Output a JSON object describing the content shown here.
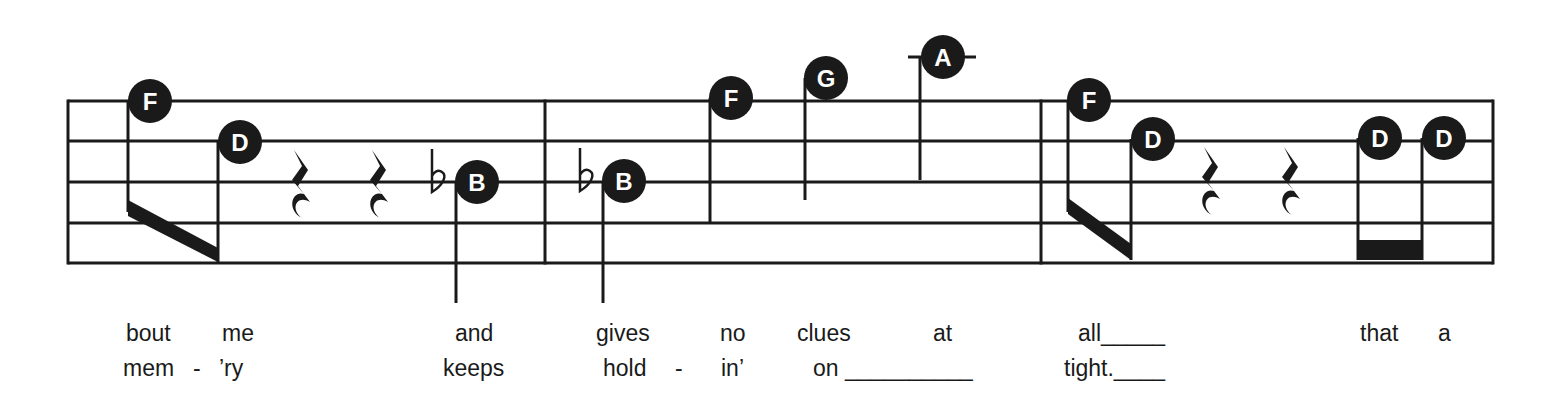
{
  "colors": {
    "ink": "#1a1a1a",
    "paper": "#ffffff",
    "note_text": "#ffffff"
  },
  "staff": {
    "x_start": 68,
    "x_end": 1493,
    "lines_y": [
      101,
      141,
      182,
      223,
      263
    ],
    "barlines_x": [
      68,
      545,
      1041,
      1493
    ]
  },
  "notes": [
    {
      "letter": "F",
      "cx": 150,
      "cy": 101,
      "stem_x": 128,
      "stem_top": 101,
      "stem_bottom": 212
    },
    {
      "letter": "D",
      "cx": 240,
      "cy": 142,
      "stem_x": 218,
      "stem_top": 142,
      "stem_bottom": 262
    },
    {
      "letter": "B",
      "cx": 477,
      "cy": 182,
      "stem_x": 456,
      "stem_top": 182,
      "stem_bottom": 303,
      "flat_x": 432
    },
    {
      "letter": "B",
      "cx": 624,
      "cy": 181,
      "stem_x": 603,
      "stem_top": 181,
      "stem_bottom": 303,
      "flat_x": 580
    },
    {
      "letter": "F",
      "cx": 731,
      "cy": 98,
      "stem_x": 710,
      "stem_top": 98,
      "stem_bottom": 222
    },
    {
      "letter": "G",
      "cx": 826,
      "cy": 78,
      "stem_x": 805,
      "stem_top": 78,
      "stem_bottom": 200
    },
    {
      "letter": "A",
      "cx": 943,
      "cy": 57,
      "stem_x": 920,
      "stem_top": 57,
      "stem_bottom": 180,
      "ledger": [
        908,
        976
      ]
    },
    {
      "letter": "F",
      "cx": 1089,
      "cy": 100,
      "stem_x": 1068,
      "stem_top": 100,
      "stem_bottom": 212
    },
    {
      "letter": "D",
      "cx": 1153,
      "cy": 139,
      "stem_x": 1131,
      "stem_top": 139,
      "stem_bottom": 260
    },
    {
      "letter": "D",
      "cx": 1380,
      "cy": 138,
      "stem_x": 1358,
      "stem_top": 138,
      "stem_bottom": 260
    },
    {
      "letter": "D",
      "cx": 1444,
      "cy": 138,
      "stem_x": 1422,
      "stem_top": 138,
      "stem_bottom": 260
    }
  ],
  "beams": [
    {
      "points": "128,200 218,248 218,262 128,216"
    },
    {
      "points": "1068,198 1131,244 1131,260 1068,214"
    },
    {
      "points": "1358,240 1422,240 1422,260 1358,260"
    }
  ],
  "rests": [
    {
      "x": 302,
      "y": 150
    },
    {
      "x": 380,
      "y": 150
    },
    {
      "x": 1212,
      "y": 147
    },
    {
      "x": 1292,
      "y": 147
    }
  ],
  "lyrics": {
    "line1": [
      {
        "text": "bout",
        "x": 126
      },
      {
        "text": "me",
        "x": 222
      },
      {
        "text": "and",
        "x": 455
      },
      {
        "text": "gives",
        "x": 596
      },
      {
        "text": "no",
        "x": 720
      },
      {
        "text": "clues",
        "x": 797
      },
      {
        "text": "at",
        "x": 933
      },
      {
        "text": "all_____",
        "x": 1078
      },
      {
        "text": "that",
        "x": 1360
      },
      {
        "text": "a",
        "x": 1438
      }
    ],
    "line2": [
      {
        "text": "mem",
        "x": 123
      },
      {
        "text": "-",
        "x": 193
      },
      {
        "text": "’ry",
        "x": 219
      },
      {
        "text": "keeps",
        "x": 443
      },
      {
        "text": "hold",
        "x": 603
      },
      {
        "text": "-",
        "x": 675
      },
      {
        "text": "in’",
        "x": 721
      },
      {
        "text": "on __________",
        "x": 813
      },
      {
        "text": "tight.____",
        "x": 1064
      }
    ]
  }
}
